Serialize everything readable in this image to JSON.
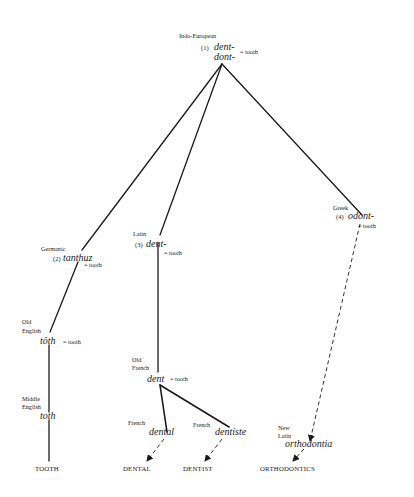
{
  "diagram": {
    "type": "etymology-tree",
    "nodes": {
      "root": {
        "language": "Indo-European",
        "number": "(1)",
        "form_line1": "dent-",
        "form_line2": "dont-",
        "gloss": "= tooth"
      },
      "germanic": {
        "language": "Germanic",
        "number": "(2)",
        "form": "tanthuz",
        "gloss": "= tooth"
      },
      "latin": {
        "language": "Latin",
        "number": "(3)",
        "form": "dent-",
        "gloss": "= tooth"
      },
      "greek": {
        "language": "Greek",
        "number": "(4)",
        "form": "odont-",
        "gloss": "= tooth"
      },
      "old_english": {
        "language_line1": "Old",
        "language_line2": "English",
        "form": "tōth",
        "gloss": "= tooth"
      },
      "middle_english": {
        "language_line1": "Middle",
        "language_line2": "English",
        "form": "toth"
      },
      "old_french": {
        "language_line1": "Old",
        "language_line2": "French",
        "form": "dent",
        "gloss": "= tooth"
      },
      "french_dental": {
        "language": "French",
        "form": "dental"
      },
      "french_dentiste": {
        "language": "French",
        "form": "dentiste"
      },
      "new_latin": {
        "language_line1": "New",
        "language_line2": "Latin",
        "form": "orthodontia"
      }
    },
    "outputs": {
      "tooth": "TOOTH",
      "dental": "DENTAL",
      "dentist": "DENTIST",
      "orthodontics": "ORTHODONTICS"
    },
    "edges": [
      {
        "from": "root",
        "to": "germanic",
        "style": "solid"
      },
      {
        "from": "root",
        "to": "latin",
        "style": "solid"
      },
      {
        "from": "root",
        "to": "greek",
        "style": "solid"
      },
      {
        "from": "germanic",
        "to": "old_english",
        "style": "solid"
      },
      {
        "from": "old_english",
        "to": "middle_english",
        "style": "solid"
      },
      {
        "from": "middle_english",
        "to": "tooth",
        "style": "solid"
      },
      {
        "from": "latin",
        "to": "old_french",
        "style": "solid"
      },
      {
        "from": "old_french",
        "to": "french_dental",
        "style": "solid"
      },
      {
        "from": "old_french",
        "to": "french_dentiste",
        "style": "solid"
      },
      {
        "from": "french_dental",
        "to": "dental",
        "style": "dashed-arrow"
      },
      {
        "from": "french_dentiste",
        "to": "dentist",
        "style": "dashed-arrow"
      },
      {
        "from": "greek",
        "to": "new_latin",
        "style": "dashed-arrow"
      },
      {
        "from": "new_latin",
        "to": "orthodontics",
        "style": "dashed-arrow"
      }
    ],
    "colors": {
      "ink": "#1a1a1a",
      "background": "#ffffff"
    }
  }
}
